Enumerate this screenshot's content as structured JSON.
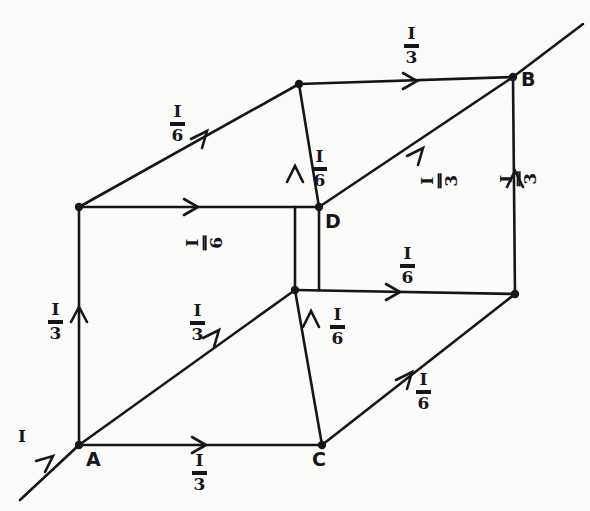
{
  "figure": {
    "kind": "hand-drawn-cube-current-diagram",
    "ink_color": "#16161a",
    "paper_color": "#fbfbf9",
    "width": 590,
    "height": 511
  },
  "vertices": [
    {
      "id": "A",
      "name": "vertex-a",
      "label": "A",
      "x": 79,
      "y": 445,
      "label_x": 86,
      "label_y": 450,
      "dot": true
    },
    {
      "id": "C",
      "name": "vertex-c",
      "label": "C",
      "x": 322,
      "y": 445,
      "label_x": 312,
      "label_y": 450,
      "dot": true
    },
    {
      "id": "D",
      "name": "vertex-d",
      "label": "D",
      "x": 319,
      "y": 207,
      "label_x": 325,
      "label_y": 212,
      "dot": true
    },
    {
      "id": "B",
      "name": "vertex-b",
      "label": "B",
      "x": 513,
      "y": 77,
      "label_x": 521,
      "label_y": 70,
      "dot": true
    },
    {
      "id": "TL",
      "name": "vertex-top-left",
      "label": "",
      "x": 79,
      "y": 207,
      "dot": true
    },
    {
      "id": "TB",
      "name": "vertex-top-back",
      "label": "",
      "x": 299,
      "y": 84,
      "dot": true
    },
    {
      "id": "FR",
      "name": "vertex-front-right",
      "label": "",
      "x": 515,
      "y": 294,
      "dot": true
    },
    {
      "id": "MR",
      "name": "vertex-mid-right",
      "label": "",
      "x": 295,
      "y": 290,
      "dot": true
    }
  ],
  "edges": [
    {
      "name": "edge-a-to-c",
      "from": "A",
      "to": "C",
      "value": "I/3",
      "numerator": "I",
      "denominator": "3"
    },
    {
      "name": "edge-a-to-tl",
      "from": "A",
      "to": "TL",
      "value": "I/3",
      "numerator": "I",
      "denominator": "3"
    },
    {
      "name": "edge-a-to-mr",
      "from": "A",
      "to": "MR",
      "value": "I/3",
      "numerator": "I",
      "denominator": "3"
    },
    {
      "name": "edge-c-to-mr",
      "from": "C",
      "to": "MR",
      "value": "I/6",
      "numerator": "I",
      "denominator": "6"
    },
    {
      "name": "edge-c-to-fr",
      "from": "C",
      "to": "FR",
      "value": "I/6",
      "numerator": "I",
      "denominator": "6"
    },
    {
      "name": "edge-tl-to-tb",
      "from": "TL",
      "to": "TB",
      "value": "I/6",
      "numerator": "I",
      "denominator": "6"
    },
    {
      "name": "edge-tl-to-d",
      "from": "TL",
      "to": "D",
      "value": "I/6",
      "numerator": "I",
      "denominator": "6"
    },
    {
      "name": "edge-mr-to-d",
      "from": "MR",
      "to": "D",
      "value": "I/6",
      "numerator": "I",
      "denominator": "6"
    },
    {
      "name": "edge-mr-to-fr",
      "from": "MR",
      "to": "FR",
      "value": "I/6",
      "numerator": "I",
      "denominator": "6"
    },
    {
      "name": "edge-tb-to-b",
      "from": "TB",
      "to": "B",
      "value": "I/3",
      "numerator": "I",
      "denominator": "3"
    },
    {
      "name": "edge-d-to-b",
      "from": "D",
      "to": "B",
      "value": "I/3",
      "numerator": "I",
      "denominator": "3"
    },
    {
      "name": "edge-fr-to-b",
      "from": "FR",
      "to": "B",
      "value": "I/3",
      "numerator": "I",
      "denominator": "3"
    },
    {
      "name": "edge-tb-to-d",
      "from": "TB",
      "to": "D",
      "value": "",
      "numerator": "",
      "denominator": ""
    },
    {
      "name": "edge-inflow-to-a",
      "from": "IN",
      "to": "A",
      "value": "I",
      "numerator": "I",
      "denominator": ""
    },
    {
      "name": "edge-b-to-outflow",
      "from": "B",
      "to": "OUT",
      "value": "",
      "numerator": "",
      "denominator": ""
    }
  ],
  "labels": {
    "inflow": {
      "name": "label-inflow-i",
      "text": "I",
      "x": 18,
      "y": 428,
      "rotated": false,
      "fraction": false
    },
    "bottom_a_c": {
      "name": "label-edge-a-c",
      "num": "I",
      "den": "3",
      "x": 192,
      "y": 452,
      "rotated": false,
      "fraction": true
    },
    "left_vertical": {
      "name": "label-edge-a-tl",
      "num": "I",
      "den": "3",
      "x": 48,
      "y": 301,
      "rotated": false,
      "fraction": true
    },
    "mid_diagonal": {
      "name": "label-edge-a-mr",
      "num": "I",
      "den": "3",
      "x": 190,
      "y": 302,
      "rotated": false,
      "fraction": true
    },
    "c_vertical": {
      "name": "label-edge-c-mr",
      "num": "I",
      "den": "6",
      "x": 330,
      "y": 306,
      "rotated": false,
      "fraction": true
    },
    "lower_right_diag": {
      "name": "label-edge-c-fr",
      "num": "I",
      "den": "6",
      "x": 416,
      "y": 371,
      "rotated": false,
      "fraction": true
    },
    "upper_left_diag": {
      "name": "label-edge-tl-tb",
      "num": "I",
      "den": "6",
      "x": 170,
      "y": 103,
      "rotated": false,
      "fraction": true
    },
    "tl_horizontal": {
      "name": "label-edge-tl-d",
      "num": "I",
      "den": "6",
      "x": 197,
      "y": 222,
      "rotated": true,
      "fraction": true
    },
    "mr_vertical": {
      "name": "label-edge-mr-d",
      "num": "I",
      "den": "6",
      "x": 312,
      "y": 148,
      "rotated": false,
      "fraction": true
    },
    "mr_horizontal": {
      "name": "label-edge-mr-fr",
      "num": "I",
      "den": "6",
      "x": 400,
      "y": 245,
      "rotated": false,
      "fraction": true
    },
    "top_horizontal": {
      "name": "label-edge-tb-b",
      "num": "I",
      "den": "3",
      "x": 404,
      "y": 25,
      "rotated": false,
      "fraction": true
    },
    "upper_right_diag": {
      "name": "label-edge-d-b",
      "num": "I",
      "den": "3",
      "x": 432,
      "y": 160,
      "rotated": true,
      "fraction": true
    },
    "right_vertical": {
      "name": "label-edge-fr-b",
      "num": "I",
      "den": "3",
      "x": 511,
      "y": 158,
      "rotated": true,
      "fraction": true
    }
  }
}
